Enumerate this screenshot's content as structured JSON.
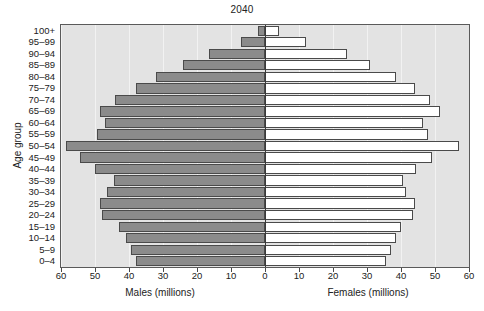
{
  "chart_data": {
    "type": "bar",
    "subtype": "population-pyramid",
    "title": "2040",
    "ylabel": "Age group",
    "xlabel_left": "Males (millions)",
    "xlabel_right": "Females (millions)",
    "xlim": [
      0,
      60
    ],
    "xticks": [
      60,
      50,
      40,
      30,
      20,
      10,
      0,
      10,
      20,
      30,
      40,
      50,
      60
    ],
    "grid": true,
    "legend": "none",
    "categories": [
      "0-4",
      "5-9",
      "10-14",
      "15-19",
      "20-24",
      "25-29",
      "30-34",
      "35-39",
      "40-44",
      "45-49",
      "50-54",
      "55-59",
      "60-64",
      "65-69",
      "70-74",
      "75-79",
      "80-84",
      "85-89",
      "90-94",
      "95-99",
      "100+"
    ],
    "series": [
      {
        "name": "Males (millions)",
        "direction": "left",
        "color": "#8b8b8b",
        "values": [
          38.0,
          39.5,
          41.0,
          43.0,
          48.0,
          48.5,
          46.5,
          44.5,
          50.0,
          54.5,
          58.5,
          49.5,
          47.0,
          48.5,
          44.0,
          38.0,
          32.0,
          24.0,
          16.5,
          7.0,
          2.0
        ]
      },
      {
        "name": "Females (millions)",
        "direction": "right",
        "color": "#ffffff",
        "values": [
          35.5,
          37.0,
          38.5,
          40.0,
          43.5,
          44.0,
          41.5,
          40.5,
          44.5,
          49.0,
          57.0,
          48.0,
          46.5,
          51.5,
          48.5,
          44.0,
          38.5,
          31.0,
          24.0,
          12.0,
          4.0
        ]
      }
    ]
  },
  "axis": {
    "y_ticks": [
      "100+",
      "95-99",
      "90-94",
      "85-89",
      "80-84",
      "75-79",
      "70-74",
      "65-69",
      "60-64",
      "55-59",
      "50-54",
      "45-49",
      "40-44",
      "35-39",
      "30-34",
      "25-29",
      "20-24",
      "15-19",
      "10-14",
      "5-9",
      "0-4"
    ]
  },
  "colors": {
    "plot_background": "#e3e3e3",
    "male_bar": "#8b8b8b",
    "female_bar": "#ffffff",
    "bar_outline": "#4a4a4a",
    "axis_line": "#5a5a5a",
    "gridline": "#f2f2f2",
    "text": "#222222"
  }
}
